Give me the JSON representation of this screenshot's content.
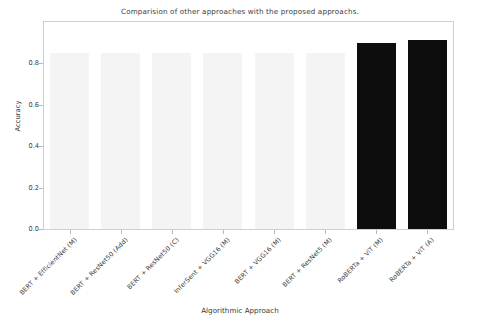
{
  "chart_data": {
    "type": "bar",
    "title": "Comparision of other approaches with the proposed approachs.",
    "xlabel": "Algorithmic Approach",
    "ylabel": "Accuracy",
    "categories": [
      "BERT + EfficientNet (M)",
      "BERT + ResNet50 (Add)",
      "BERT + ResNet50 (C)",
      "InferSent + VGG16 (M)",
      "BERT + VGG16 (M)",
      "BERT + ResNet5 (M)",
      "RoBERTa + ViT (M)",
      "RoBERTa + ViT (A)"
    ],
    "values": [
      0.85,
      0.85,
      0.85,
      0.85,
      0.85,
      0.85,
      0.9,
      0.915
    ],
    "ylim": [
      0.0,
      1.0
    ],
    "yticks": [
      "0.0",
      "0.2",
      "0.4",
      "0.6",
      "0.8"
    ],
    "ytick_values": [
      0.0,
      0.2,
      0.4,
      0.6,
      0.8
    ],
    "grid": false,
    "legend": "none",
    "bar_colors": [
      "#f4f4f4",
      "#f4f4f4",
      "#f4f4f4",
      "#f4f4f4",
      "#f4f4f4",
      "#f4f4f4",
      "#0d0d0d",
      "#0d0d0d"
    ],
    "highlight_color": "#0d0d0d",
    "baseline_color": "#f4f4f4",
    "axis_color": "#cfcfcf",
    "text_color": "#3b3b3b"
  }
}
